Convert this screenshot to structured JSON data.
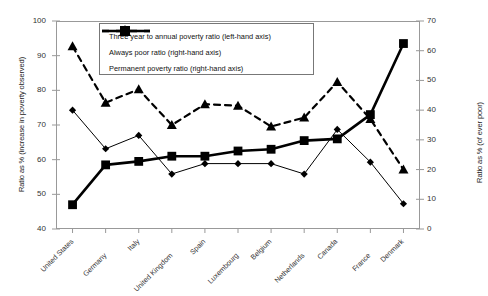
{
  "chart_data": {
    "type": "line",
    "title": "",
    "xlabel": "",
    "ylabel": "Ratio as % (increase in poverty observed)",
    "ylabel_right": "Ratio  as % (of ever poor)",
    "categories": [
      "United States",
      "Germany",
      "Italy",
      "United Kingdom",
      "Spain",
      "Luxembourg",
      "Belgium",
      "Netherlands",
      "Canada",
      "France",
      "Denmark"
    ],
    "ylim": [
      40,
      100
    ],
    "ylim_right": [
      0,
      70
    ],
    "yticks": [
      40,
      50,
      60,
      70,
      80,
      90,
      100
    ],
    "yticks_right": [
      0,
      10,
      20,
      30,
      40,
      50,
      60,
      70
    ],
    "grid": false,
    "legend_position": "top-center-inside",
    "series": [
      {
        "name": "Three year to annual poverty ratio (left-hand axis)",
        "axis": "left",
        "marker": "square",
        "line": "solid-thick",
        "values": [
          47,
          58.5,
          59.5,
          61,
          61,
          62.5,
          63,
          65.5,
          66,
          73,
          93.5
        ]
      },
      {
        "name": "Always poor ratio (right-hand axis)",
        "axis": "right",
        "marker": "diamond",
        "line": "solid-thin",
        "values": [
          40,
          27,
          31.5,
          18.5,
          22,
          22,
          22,
          18.5,
          33.5,
          22.5,
          8.5
        ]
      },
      {
        "name": "Permanent poverty ratio (right-hand axis)",
        "axis": "right",
        "marker": "triangle",
        "line": "dashed",
        "values": [
          61.5,
          42.5,
          47,
          35,
          42,
          41.5,
          34.5,
          37.5,
          49.5,
          37,
          20
        ]
      }
    ]
  }
}
